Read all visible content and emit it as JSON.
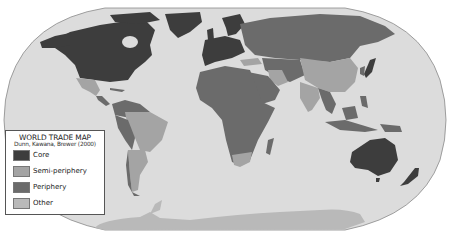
{
  "legend": {
    "title": "WORLD TRADE MAP",
    "subtitle": "Dunn, Kawana, Brewer (2000)",
    "items": [
      {
        "label": "Core",
        "color": "#3d3d3d"
      },
      {
        "label": "Semi-periphery",
        "color": "#a4a4a4"
      },
      {
        "label": "Periphery",
        "color": "#6b6b6b"
      },
      {
        "label": "Other",
        "color": "#b9b9b9"
      }
    ]
  },
  "colors": {
    "ocean": "#dcdcdc",
    "outline": "#8a8a8a",
    "background": "#ffffff"
  },
  "regions": {
    "core": [
      "North America (USA, Canada)",
      "Greenland",
      "Western Europe",
      "Scandinavia",
      "Japan",
      "Australia",
      "New Zealand"
    ],
    "semi_periphery": [
      "Mexico",
      "Brazil",
      "Argentina",
      "China",
      "India",
      "Iran",
      "South Africa",
      "Turkey"
    ],
    "periphery": [
      "Russia",
      "Africa",
      "Middle East",
      "Central Asia",
      "Southeast Asia",
      "Central America",
      "Andean South America"
    ],
    "other": [
      "Antarctica"
    ]
  }
}
